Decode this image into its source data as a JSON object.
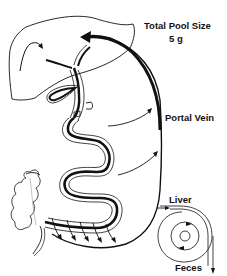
{
  "diagram": {
    "labels": {
      "total_pool_size": "Total Pool Size",
      "pool_size_value": "5 g",
      "portal_vein": "Portal Vein",
      "liver": "Liver",
      "feces": "Feces"
    },
    "structures": [
      "liver",
      "gallbladder",
      "bile-duct",
      "duodenum",
      "small-intestine",
      "ileum",
      "colon",
      "portal-vein-return-arrow",
      "enterohepatic-cycle-schematic"
    ],
    "colors": {
      "stroke": "#111111",
      "background": "#ffffff"
    }
  }
}
